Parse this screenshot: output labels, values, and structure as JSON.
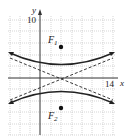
{
  "diagram": {
    "type": "hyperbola-graph",
    "axes": {
      "x_label": "x",
      "y_label": "y",
      "x_tick_label": "14",
      "y_tick_label": "10"
    },
    "foci": [
      {
        "label": "F",
        "sub": "1"
      },
      {
        "label": "F",
        "sub": "2"
      }
    ],
    "colors": {
      "curve": "#222222",
      "grid": "#bbbbbb",
      "axis": "#333333"
    }
  }
}
